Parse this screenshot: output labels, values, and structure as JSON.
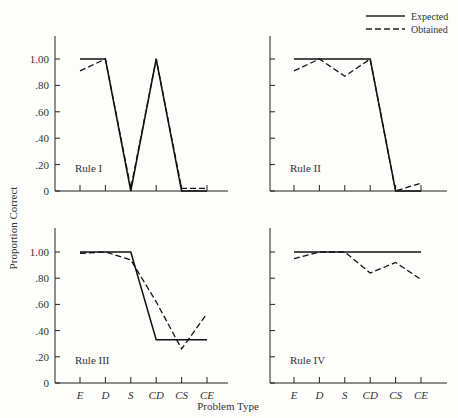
{
  "chart_data": {
    "type": "line",
    "layout": "2x2 small multiples, shared axes",
    "xlabel": "Problem Type",
    "ylabel": "Proportion Correct",
    "categories": [
      "E",
      "D",
      "S",
      "CD",
      "CS",
      "CE"
    ],
    "ylim": [
      0,
      1.0
    ],
    "yticks": [
      "0",
      ".20",
      ".40",
      ".60",
      ".80",
      "1.00"
    ],
    "grid": false,
    "legend": {
      "position": "top-right",
      "entries": [
        {
          "name": "Expected",
          "style": "solid"
        },
        {
          "name": "Obtained",
          "style": "dashed"
        }
      ]
    },
    "panels": [
      {
        "title": "Rule I",
        "series": [
          {
            "name": "Expected",
            "values": [
              1.0,
              1.0,
              0.0,
              1.0,
              0.0,
              0.0
            ]
          },
          {
            "name": "Obtained",
            "values": [
              0.91,
              1.0,
              0.02,
              1.0,
              0.02,
              0.02
            ]
          }
        ]
      },
      {
        "title": "Rule II",
        "series": [
          {
            "name": "Expected",
            "values": [
              1.0,
              1.0,
              1.0,
              1.0,
              0.0,
              0.0
            ]
          },
          {
            "name": "Obtained",
            "values": [
              0.91,
              1.0,
              0.87,
              1.0,
              0.0,
              0.06
            ]
          }
        ]
      },
      {
        "title": "Rule III",
        "series": [
          {
            "name": "Expected",
            "values": [
              1.0,
              1.0,
              1.0,
              0.33,
              0.33,
              0.33
            ]
          },
          {
            "name": "Obtained",
            "values": [
              0.99,
              1.0,
              0.94,
              0.62,
              0.26,
              0.53
            ]
          }
        ]
      },
      {
        "title": "Rule IV",
        "series": [
          {
            "name": "Expected",
            "values": [
              1.0,
              1.0,
              1.0,
              1.0,
              1.0,
              1.0
            ]
          },
          {
            "name": "Obtained",
            "values": [
              0.95,
              1.0,
              1.0,
              0.84,
              0.92,
              0.79
            ]
          }
        ]
      }
    ]
  },
  "labels": {
    "xlabel": "Problem Type",
    "ylabel": "Proportion Correct",
    "legend_expected": "Expected",
    "legend_obtained": "Obtained",
    "panel_titles": [
      "Rule I",
      "Rule II",
      "Rule III",
      "Rule IV"
    ],
    "categories": [
      "E",
      "D",
      "S",
      "CD",
      "CS",
      "CE"
    ],
    "yticks": [
      "0",
      ".20",
      ".40",
      ".60",
      ".80",
      "1.00"
    ]
  }
}
